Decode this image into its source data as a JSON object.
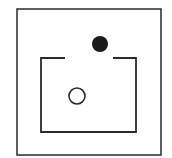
{
  "diagram": {
    "background": "#ffffff",
    "stroke_color": "#2a2a2a",
    "outer_box": {
      "x": 17,
      "y": 9,
      "width": 144,
      "height": 146
    },
    "inner_box": {
      "left": 41,
      "right": 136,
      "top": 58,
      "bottom": 132,
      "gap_start": 65,
      "gap_end": 113
    },
    "filled_circle": {
      "cx": 100,
      "cy": 44,
      "r": 8,
      "fill": "#1a1a1a"
    },
    "open_circle": {
      "cx": 77,
      "cy": 96,
      "r": 8,
      "stroke": "#2a2a2a"
    }
  }
}
